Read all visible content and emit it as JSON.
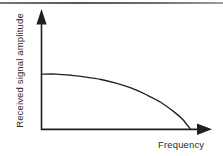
{
  "figure": {
    "y_axis_label": "Received signal amplitude",
    "x_axis_label": "Frequency",
    "line_color": "#231f20",
    "background_color": "#ffffff"
  },
  "chart_data": {
    "type": "line",
    "title": "",
    "subtitle": "",
    "xlabel": "Frequency",
    "ylabel": "Received signal amplitude",
    "xlim": [
      0,
      1
    ],
    "ylim": [
      0,
      1
    ],
    "grid": false,
    "legend": null,
    "axis_style": "arrow-headed, no tick marks, no tick labels",
    "annotations": [],
    "series": [
      {
        "name": "Received signal amplitude vs frequency",
        "x": [
          0.0,
          0.1,
          0.2,
          0.3,
          0.4,
          0.5,
          0.6,
          0.7,
          0.8,
          0.9,
          0.95,
          1.0
        ],
        "values": [
          0.92,
          0.92,
          0.9,
          0.87,
          0.83,
          0.77,
          0.69,
          0.58,
          0.45,
          0.27,
          0.16,
          0.0
        ]
      }
    ]
  }
}
